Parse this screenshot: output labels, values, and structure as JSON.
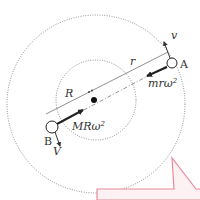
{
  "diagram": {
    "type": "binary-star-rotation",
    "bodies": [
      {
        "id": "A",
        "label": "A",
        "velocity_label": "v",
        "force_label": "mrω",
        "force_exp": "2",
        "radius_label": "r"
      },
      {
        "id": "B",
        "label": "B",
        "velocity_label": "V",
        "force_label": "MRω",
        "force_exp": "2",
        "radius_label": "R"
      }
    ],
    "colors": {
      "line": "#333333",
      "orbit": "#555555",
      "callout_border": "#e88a9a",
      "callout_fill": "#fdf2f3"
    }
  }
}
